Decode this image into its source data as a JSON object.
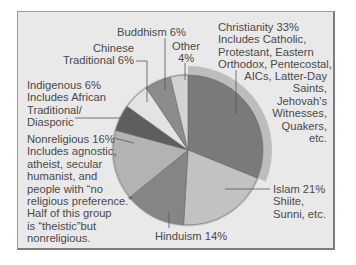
{
  "chart_data": {
    "type": "pie",
    "title": "",
    "slices": [
      {
        "name": "Christianity",
        "value": 33,
        "color": "#7a7a7a",
        "note": "Includes Catholic, Protestant, Eastern Orthodox, Pentecostal, AICs, Latter-Day Saints, Jehovah's Witnesses, Quakers, etc."
      },
      {
        "name": "Islam",
        "value": 21,
        "color": "#c2c2c2",
        "note": "Shiite, Sunni, etc."
      },
      {
        "name": "Hinduism",
        "value": 14,
        "color": "#858585",
        "note": ""
      },
      {
        "name": "Nonreligious",
        "value": 16,
        "color": "#b3b3b3",
        "note": "Includes agnostic, atheist, secular humanist, and people with \"no religious preference.\" Half of this group is \"theistic\"but nonreligious."
      },
      {
        "name": "Indigenous",
        "value": 6,
        "color": "#5e5e5e",
        "note": "Includes African Traditional/ Diasporic"
      },
      {
        "name": "Chinese Traditional",
        "value": 6,
        "color": "#e3e3e3",
        "note": ""
      },
      {
        "name": "Buddhism",
        "value": 6,
        "color": "#8c8c8c",
        "note": ""
      },
      {
        "name": "Other",
        "value": 4,
        "color": "#d2d2d2",
        "note": ""
      }
    ],
    "legend_position": "none (callout labels)"
  },
  "labels": {
    "christianity": "Christianity 33%\nIncludes Catholic,\nProtestant, Eastern\nOrthodox, Pentecostal,",
    "christianity_b": "AICs, Latter-Day\nSaints,\nJehovah's\nWitnesses,\nQuakers,\netc.",
    "islam": "Islam 21%\nShiite,\nSunni, etc.",
    "hinduism": "Hinduism 14%",
    "nonreligious": "Nonreligious 16%\nIncludes agnostic,\natheist, secular\nhumanist, and\npeople with “no\nreligious preference.”\nHalf of this group\nis “theistic”but\nnonreligious.",
    "indigenous": "Indigenous 6%\nIncludes African\nTraditional/\nDiasporic",
    "chinese": "Chinese\nTraditional 6%",
    "buddhism": "Buddhism 6%",
    "other": "Other\n4%"
  }
}
